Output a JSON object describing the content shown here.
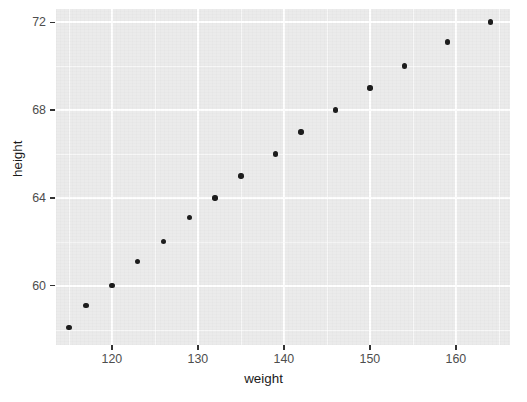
{
  "chart_data": {
    "type": "scatter",
    "title": "",
    "xlabel": "weight",
    "ylabel": "height",
    "xlim": [
      113.5,
      166.3
    ],
    "ylim": [
      57.3,
      72.6
    ],
    "x_ticks": [
      120,
      130,
      140,
      150,
      160
    ],
    "y_ticks": [
      60,
      64,
      68,
      72
    ],
    "x_minor_ticks": [
      115,
      125,
      135,
      145,
      155,
      165
    ],
    "y_minor_ticks": [
      58,
      62,
      66,
      70,
      72
    ],
    "grid": true,
    "legend": false,
    "legend_position": "none",
    "panel_background": "#ebebeb",
    "gridline_color": "#ffffff",
    "point_color": "#1a1a1a",
    "series": [
      {
        "name": "observations",
        "x": [
          115,
          117,
          120,
          123,
          126,
          129,
          132,
          135,
          139,
          142,
          146,
          150,
          154,
          159,
          164
        ],
        "y": [
          58.1,
          59.1,
          60.0,
          61.1,
          62.0,
          63.1,
          64.0,
          65.0,
          66.0,
          67.0,
          68.0,
          69.0,
          70.0,
          71.1,
          72.0
        ]
      }
    ],
    "points": [
      {
        "weight": 115,
        "height": 58.1
      },
      {
        "weight": 117,
        "height": 59.1
      },
      {
        "weight": 120,
        "height": 60.0
      },
      {
        "weight": 123,
        "height": 61.1
      },
      {
        "weight": 126,
        "height": 62.0
      },
      {
        "weight": 129,
        "height": 63.1
      },
      {
        "weight": 132,
        "height": 64.0
      },
      {
        "weight": 135,
        "height": 65.0
      },
      {
        "weight": 139,
        "height": 66.0
      },
      {
        "weight": 142,
        "height": 67.0
      },
      {
        "weight": 146,
        "height": 68.0
      },
      {
        "weight": 150,
        "height": 69.0
      },
      {
        "weight": 154,
        "height": 70.0
      },
      {
        "weight": 159,
        "height": 71.1
      },
      {
        "weight": 164,
        "height": 72.0
      }
    ]
  },
  "axes": {
    "x_title": "weight",
    "y_title": "height",
    "x_tick_labels": [
      "120",
      "130",
      "140",
      "150",
      "160"
    ],
    "y_tick_labels": [
      "72",
      "68",
      "64",
      "60"
    ]
  }
}
